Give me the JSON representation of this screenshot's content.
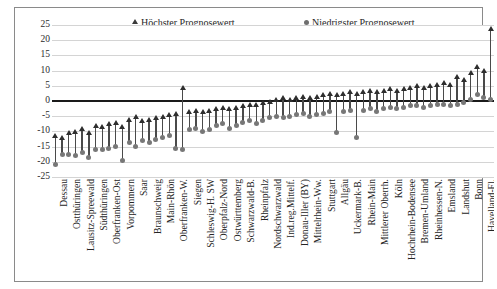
{
  "chart_data": {
    "type": "bar",
    "title": "",
    "subtitle": "",
    "xlabel": "",
    "ylabel": "",
    "ylim": [
      -25,
      25
    ],
    "ytick_step": 5,
    "yticks": [
      "25",
      "20",
      "15",
      "10",
      "5",
      "0",
      "-5",
      "-10",
      "-15",
      "-20",
      "-25"
    ],
    "grid": true,
    "legend_position": "top",
    "legend": [
      {
        "label": "Höchster Prognosewert",
        "marker": "triangle",
        "color": "#2e2e2e"
      },
      {
        "label": "Niedrigster Prognosewert",
        "marker": "circle",
        "color": "#777777"
      }
    ],
    "series": [
      {
        "name": "Höchster Prognosewert",
        "marker": "triangle"
      },
      {
        "name": "Niedrigster Prognosewert",
        "marker": "circle"
      }
    ],
    "categories": [
      "Dessau",
      "",
      "Ostthüringen",
      "",
      "Lausitz-Spreewald",
      "",
      "Südthüringen",
      "",
      "Oberfranken-Ost",
      "",
      "Vorpommern",
      "",
      "Saar",
      "",
      "Braunschweig",
      "",
      "Main-Rhön",
      "",
      "Oberfranken-W.",
      "",
      "Siegen",
      "",
      "Schleswig-H. SW",
      "",
      "Oberpfalz-Nord",
      "",
      "Ostwürttemberg",
      "",
      "Schwarzwald-B.",
      "",
      "Rheinpfalz",
      "",
      "Nordschwarzwald",
      "",
      "Ind.reg.Mittelf.",
      "",
      "Donau-Iller (BY)",
      "",
      "Mittelrhein-Ww.",
      "",
      "Stuttgart",
      "",
      "Allgäu",
      "",
      "Uckermark-B.",
      "",
      "Rhein-Main",
      "",
      "Mittlerer Oberrh.",
      "",
      "Köln",
      "",
      "Hochrhein-Bodensee",
      "",
      "Bremen-Umland",
      "",
      "Rheinhessen-N.",
      "",
      "Emsland",
      "",
      "Landshut",
      "",
      "Bonn",
      "",
      "Havelland-Fl."
    ],
    "high_values": [
      -11.5,
      -12.0,
      -10.5,
      -10.0,
      -9.0,
      -10.5,
      -8.0,
      -8.5,
      -7.5,
      -7.0,
      -8.5,
      -6.0,
      -5.0,
      -6.5,
      -6.0,
      -5.5,
      -5.0,
      -4.5,
      -4.0,
      4.5,
      -3.5,
      -3.0,
      -3.5,
      -3.0,
      -2.5,
      -2.0,
      -2.5,
      -2.0,
      -1.5,
      -1.0,
      -1.0,
      -0.5,
      0.0,
      0.5,
      1.0,
      0.5,
      1.0,
      1.5,
      1.0,
      1.5,
      2.0,
      2.5,
      2.0,
      2.5,
      3.0,
      2.5,
      3.0,
      3.5,
      3.0,
      3.5,
      4.0,
      3.5,
      4.0,
      4.5,
      5.0,
      4.5,
      5.0,
      5.5,
      6.0,
      5.5,
      8.0,
      7.0,
      9.5,
      11.5,
      10.0,
      24.0
    ],
    "low_values": [
      -21.0,
      -17.5,
      -17.5,
      -18.0,
      -17.0,
      -18.5,
      -16.0,
      -16.0,
      -15.5,
      -15.0,
      -19.5,
      -13.5,
      -15.0,
      -13.0,
      -13.5,
      -12.5,
      -12.0,
      -11.5,
      -15.5,
      -16.0,
      -9.5,
      -9.0,
      -10.0,
      -9.5,
      -8.0,
      -7.5,
      -9.0,
      -8.0,
      -7.0,
      -6.5,
      -7.5,
      -6.5,
      -5.5,
      -5.0,
      -5.5,
      -5.0,
      -4.5,
      -4.0,
      -5.0,
      -4.5,
      -4.0,
      -3.5,
      -10.5,
      -3.5,
      -3.0,
      -12.0,
      -3.0,
      -2.5,
      -3.5,
      -2.5,
      -2.0,
      -2.5,
      -2.0,
      -1.5,
      -1.5,
      -2.0,
      -1.5,
      -1.0,
      -1.0,
      -1.5,
      -1.0,
      -0.5,
      0.5,
      2.0,
      1.0,
      0.5
    ]
  },
  "legend": {
    "high_label": "Höchster Prognosewert",
    "low_label": "Niedrigster Prognosewert"
  }
}
